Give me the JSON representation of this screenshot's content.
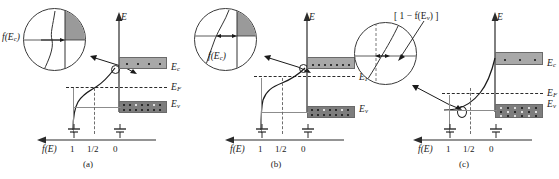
{
  "figure": {
    "type": "semiconductor-band-diagram",
    "energy_axis_label": "E",
    "distribution_axis_label": "f(E)",
    "axis_ticks": [
      "1",
      "1/2",
      "0"
    ],
    "colors": {
      "conduction_band_fill": "#a8a8a8",
      "valence_band_fill": "#7d7d7d",
      "electron_dot": "#111111",
      "hole_dot": "#ffffff",
      "line": "#2b2b2b",
      "dashed_line": "#2b2b2b",
      "gray_guide": "#8c8c8c",
      "inset_shaded_wedge": "#9a9a9a"
    }
  },
  "panels": [
    {
      "id": "a",
      "caption": "(a)",
      "inset_label": "f(E",
      "inset_label_sub": "c",
      "inset_label_close": ")",
      "inset_label_full": "f(E_c)",
      "inset_arrow": "single",
      "levels": [
        {
          "name": "Ec",
          "text": "E",
          "sub": "c"
        },
        {
          "name": "EF",
          "text": "E",
          "sub": "F"
        },
        {
          "name": "Ev",
          "text": "E",
          "sub": "v"
        }
      ],
      "fermi_position": "midgap",
      "conduction_electrons": "few",
      "valence_holes": "few",
      "axis": {
        "energy": "E",
        "distribution": "f(E)",
        "ticks": [
          "1",
          "1/2",
          "0"
        ]
      }
    },
    {
      "id": "b",
      "caption": "(b)",
      "inset_label": "f(E",
      "inset_label_sub": "c",
      "inset_label_close": ")",
      "inset_label_full": "f(E_c)",
      "inset_arrow": "double",
      "levels": [
        {
          "name": "Ec",
          "text": "E",
          "sub": "c"
        },
        {
          "name": "EF",
          "text": "E",
          "sub": "F"
        },
        {
          "name": "Ev",
          "text": "E",
          "sub": "v"
        }
      ],
      "fermi_position": "near-conduction-band",
      "conduction_electrons": "many",
      "valence_holes": "few",
      "axis": {
        "energy": "E",
        "distribution": "f(E)",
        "ticks": [
          "1",
          "1/2",
          "0"
        ]
      }
    },
    {
      "id": "c",
      "caption": "(c)",
      "inset_label_open": "[ 1 − f(E",
      "inset_label_sub": "v",
      "inset_label_close": ") ]",
      "inset_label_full": "[ 1 - f(E_v) ]",
      "inset_arrow": "double",
      "levels": [
        {
          "name": "Ec",
          "text": "E",
          "sub": "c"
        },
        {
          "name": "EF",
          "text": "E",
          "sub": "F"
        },
        {
          "name": "Ev",
          "text": "E",
          "sub": "v"
        }
      ],
      "fermi_position": "near-valence-band",
      "conduction_electrons": "few",
      "valence_holes": "many",
      "axis": {
        "energy": "E",
        "distribution": "f(E)",
        "ticks": [
          "1",
          "1/2",
          "0"
        ]
      }
    }
  ]
}
